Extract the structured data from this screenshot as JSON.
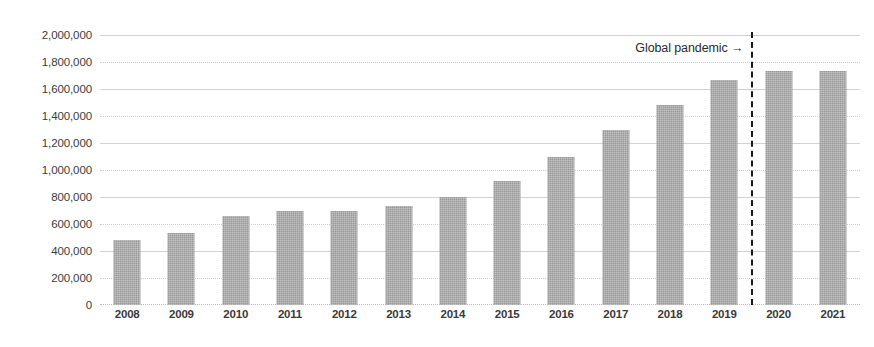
{
  "chart_data": {
    "type": "bar",
    "title": "",
    "subtitle": "",
    "xlabel": "",
    "ylabel": "",
    "categories": [
      "2008",
      "2009",
      "2010",
      "2011",
      "2012",
      "2013",
      "2014",
      "2015",
      "2016",
      "2017",
      "2018",
      "2019",
      "2020",
      "2021"
    ],
    "values": [
      485000,
      535000,
      660000,
      695000,
      695000,
      730000,
      800000,
      920000,
      1100000,
      1295000,
      1480000,
      1665000,
      1735000,
      1735000
    ],
    "series": [
      {
        "name": "",
        "values": [
          485000,
          535000,
          660000,
          695000,
          695000,
          730000,
          800000,
          920000,
          1100000,
          1295000,
          1480000,
          1665000,
          1735000,
          1735000
        ]
      }
    ],
    "ylim": [
      0,
      2000000
    ],
    "y_tick_values": [
      0,
      200000,
      400000,
      600000,
      800000,
      1000000,
      1200000,
      1400000,
      1600000,
      1800000,
      2000000
    ],
    "y_tick_labels": [
      "0",
      "200,000",
      "400,000",
      "600,000",
      "800,000",
      "1,000,000",
      "1,200,000",
      "1,400,000",
      "1,600,000",
      "1,800,000",
      "2,000,000"
    ],
    "x_tick_labels": [
      "2008",
      "2009",
      "2010",
      "2011",
      "2012",
      "2013",
      "2014",
      "2015",
      "2016",
      "2017",
      "2018",
      "2019",
      "2020",
      "2021"
    ],
    "grid": true,
    "grid_axis": "y",
    "legend": false,
    "legend_position": "none",
    "bar_color": "#989898",
    "gridline_color": "#d2d2d2",
    "text_color": "#3a3a3a",
    "annotations": [
      {
        "label": "Global pandemic →",
        "type": "vertical-line-with-label",
        "between_categories": [
          "2019",
          "2020"
        ],
        "line_style": "dashed",
        "line_color": "#1a1a1a",
        "label_position": "left-of-line-top"
      }
    ]
  }
}
